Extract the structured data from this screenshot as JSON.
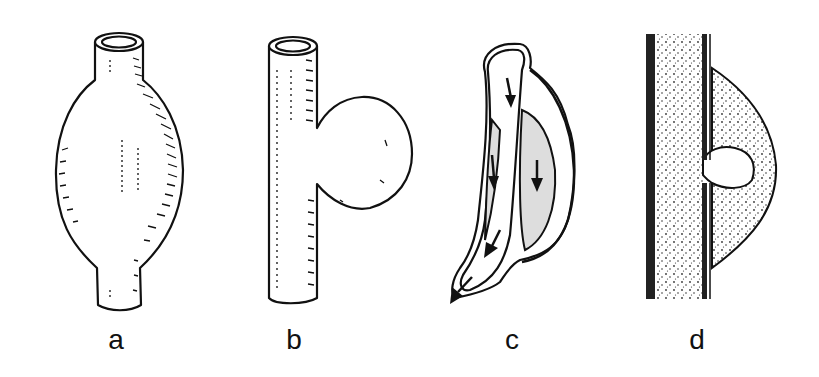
{
  "figure": {
    "panels": [
      {
        "id": "a",
        "label": "a",
        "depiction": "fusiform-aneurysm",
        "label_x": 96
      },
      {
        "id": "b",
        "label": "b",
        "depiction": "saccular-aneurysm",
        "label_x": 274
      },
      {
        "id": "c",
        "label": "c",
        "depiction": "dissecting-aneurysm",
        "label_x": 492
      },
      {
        "id": "d",
        "label": "d",
        "depiction": "false-aneurysm",
        "label_x": 677
      }
    ],
    "colors": {
      "ink": "#111111",
      "background": "#ffffff",
      "stipple": "#333333"
    }
  }
}
